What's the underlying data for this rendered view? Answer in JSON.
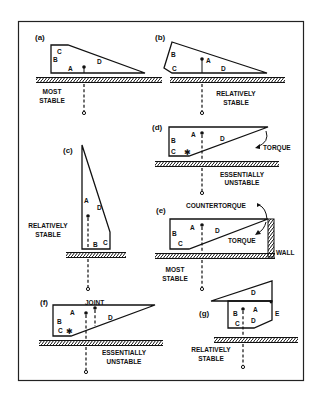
{
  "figure": {
    "frame": {
      "border_color": "#222222",
      "background": "#ffffff"
    },
    "panels": [
      {
        "id": "a",
        "label": "(a)",
        "parts": [
          "A",
          "B",
          "C",
          "D"
        ],
        "caption": [
          "MOST",
          "STABLE"
        ]
      },
      {
        "id": "b",
        "label": "(b)",
        "parts": [
          "A",
          "B",
          "C",
          "D"
        ],
        "caption": [
          "RELATIVELY",
          "STABLE"
        ]
      },
      {
        "id": "c",
        "label": "(c)",
        "parts": [
          "A",
          "B",
          "C",
          "D"
        ],
        "caption": [
          "RELATIVELY",
          "STABLE"
        ]
      },
      {
        "id": "d",
        "label": "(d)",
        "parts": [
          "A",
          "B",
          "C",
          "D"
        ],
        "caption": [
          "ESSENTIALLY",
          "UNSTABLE"
        ],
        "annotations": {
          "torque": "TORQUE"
        }
      },
      {
        "id": "e",
        "label": "(e)",
        "parts": [
          "A",
          "B",
          "C",
          "D"
        ],
        "caption": [
          "MOST",
          "STABLE"
        ],
        "annotations": {
          "countertorque": "COUNTERTORQUE",
          "torque": "TORQUE",
          "wall": "WALL"
        }
      },
      {
        "id": "f",
        "label": "(f)",
        "parts": [
          "A",
          "B",
          "C",
          "D"
        ],
        "caption": [
          "ESSENTIALLY",
          "UNSTABLE"
        ],
        "annotations": {
          "joint": "JOINT"
        }
      },
      {
        "id": "g",
        "label": "(g)",
        "parts": [
          "A",
          "B",
          "C",
          "D",
          "D",
          "E"
        ],
        "caption": [
          "RELATIVELY",
          "STABLE"
        ]
      }
    ]
  }
}
